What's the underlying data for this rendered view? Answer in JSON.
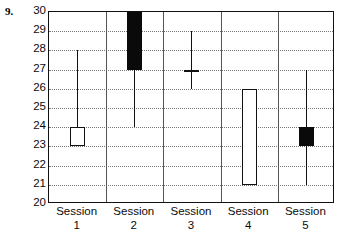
{
  "figure": {
    "question_number": "9."
  },
  "chart_data": {
    "type": "box",
    "title": "",
    "xlabel": "",
    "ylabel": "",
    "ylim": [
      20,
      30
    ],
    "grid": true,
    "legend": "none",
    "categories": [
      "Session 1",
      "Session 2",
      "Session 3",
      "Session 4",
      "Session 5"
    ],
    "category_lines": [
      {
        "line1": "Session",
        "line2": "1"
      },
      {
        "line1": "Session",
        "line2": "2"
      },
      {
        "line1": "Session",
        "line2": "3"
      },
      {
        "line1": "Session",
        "line2": "4"
      },
      {
        "line1": "Session",
        "line2": "5"
      }
    ],
    "ytick_labels": [
      "30",
      "29",
      "28",
      "27",
      "26",
      "25",
      "24",
      "23",
      "22",
      "21",
      "20"
    ],
    "yticks": [
      30,
      29,
      28,
      27,
      26,
      25,
      24,
      23,
      22,
      21,
      20
    ],
    "boxes": [
      {
        "name": "Session 1",
        "box_low": 23,
        "box_high": 24,
        "whisker_low": null,
        "whisker_high": 28,
        "median": null,
        "fill": "white",
        "style": "open-box-with-upper-whisker"
      },
      {
        "name": "Session 2",
        "box_low": 27,
        "box_high": 30,
        "whisker_low": 24,
        "whisker_high": null,
        "median": null,
        "fill": "black",
        "style": "filled-box-with-lower-whisker"
      },
      {
        "name": "Session 3",
        "box_low": 26,
        "box_high": 29,
        "whisker_low": null,
        "whisker_high": null,
        "median": 27,
        "fill": "line",
        "style": "line-with-crossbar"
      },
      {
        "name": "Session 4",
        "box_low": 21,
        "box_high": 26,
        "whisker_low": null,
        "whisker_high": null,
        "median": null,
        "fill": "white",
        "style": "open-box-only"
      },
      {
        "name": "Session 5",
        "box_low": 23,
        "box_high": 24,
        "whisker_low": 21,
        "whisker_high": 27,
        "median": null,
        "fill": "black",
        "style": "filled-box-with-both-whiskers"
      }
    ]
  },
  "colors": {
    "frame": "#111111",
    "grid": "#777777",
    "fill_dark": "#0a0a0a",
    "fill_light": "#ffffff",
    "text": "#0b0b0b",
    "background": "#ffffff"
  }
}
